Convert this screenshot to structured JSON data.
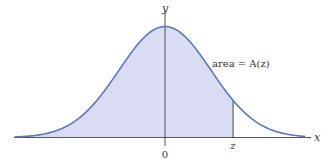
{
  "figure": {
    "axis_x_label": "x",
    "axis_y_label": "y",
    "origin_label": "0",
    "z_label": "z",
    "area_label": "area = A(z)",
    "colors": {
      "curve": "#5a78c0",
      "fill": "#d9dcf2",
      "axis": "#555555",
      "text": "#333333"
    }
  },
  "chart_data": {
    "type": "area",
    "title": "",
    "xlabel": "x",
    "ylabel": "y",
    "x_range": [
      -3.26,
      3.3
    ],
    "z_value": 1.48,
    "shaded_region": "x <= z",
    "annotations": [
      "area = A(z)",
      "0",
      "z"
    ],
    "grid": false
  }
}
